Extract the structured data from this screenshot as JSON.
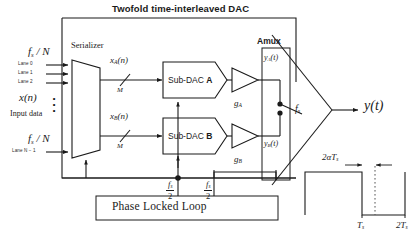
{
  "figure": {
    "title": "Twofold time-interleaved DAC",
    "type": "block-diagram"
  },
  "inputs": {
    "clock_top": "f<span class='sub'>s</span> / N",
    "clock_bottom": "f<span class='sub'>s</span> / N",
    "lanes": [
      "Lane 0",
      "Lane 1",
      "Lane 2",
      "Lane N − 1"
    ],
    "signal_label": "x(n)",
    "signal_caption": "Input data",
    "vertical_dots": "•••"
  },
  "serializer": {
    "label": "Serializer",
    "out_a": "x<span class='sub'>A</span>(n)",
    "out_b": "x<span class='sub'>B</span>(n)",
    "bus_width_a": "M",
    "bus_width_b": "M"
  },
  "subdacs": [
    {
      "name": "Sub-DAC",
      "id": "A"
    },
    {
      "name": "Sub-DAC",
      "id": "B"
    }
  ],
  "gains": {
    "a": "g<span class='sub'>A</span>",
    "b": "g<span class='sub'>B</span>"
  },
  "amux": {
    "label": "Amux",
    "in_a": "y<span class='sub'>A</span>(t)",
    "in_b": "y<span class='sub'>B</span>(t)",
    "switch_clock": "f<span class='sub'>s</span>"
  },
  "output": {
    "label": "y(t)"
  },
  "clocking": {
    "pll_label": "Phase Locked Loop",
    "clock_left_num": "f<span class='sub'>s</span>",
    "clock_left_den": "2",
    "clock_right_num": "f<span class='sub'>s</span>",
    "clock_right_den": "2"
  },
  "waveform": {
    "pulse_width_label": "2αT<span class='sub'>s</span>",
    "tick_ts": "T<span class='sub'>s</span>",
    "tick_2ts": "2T<span class='sub'>s</span>"
  },
  "colors": {
    "line": "#1a1a1a",
    "background": "#ffffff",
    "dotted": "#555555"
  }
}
